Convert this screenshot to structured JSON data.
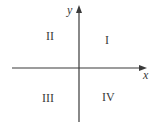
{
  "diagram": {
    "type": "cartesian-quadrants",
    "axes": {
      "x_label": "x",
      "y_label": "y",
      "line_color": "#3a3a3a"
    },
    "quadrants": [
      {
        "id": "I",
        "label": "I"
      },
      {
        "id": "II",
        "label": "II"
      },
      {
        "id": "III",
        "label": "III"
      },
      {
        "id": "IV",
        "label": "IV"
      }
    ]
  }
}
